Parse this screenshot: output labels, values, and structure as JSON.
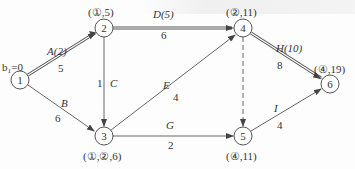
{
  "nodes": [
    {
      "id": "1",
      "x": 20,
      "y": 80,
      "label": "1",
      "annotation": "b₁=0",
      "ann_x": 2,
      "ann_y": 62
    },
    {
      "id": "2",
      "x": 104,
      "y": 28,
      "label": "2",
      "annotation": "(①,5)",
      "ann_x": 88,
      "ann_y": 7
    },
    {
      "id": "3",
      "x": 104,
      "y": 136,
      "label": "3",
      "annotation": "(①,②,6)",
      "ann_x": 83,
      "ann_y": 151
    },
    {
      "id": "4",
      "x": 243,
      "y": 28,
      "label": "4",
      "annotation": "(②,11)",
      "ann_x": 226,
      "ann_y": 7
    },
    {
      "id": "5",
      "x": 243,
      "y": 136,
      "label": "5",
      "annotation": "(④,11)",
      "ann_x": 226,
      "ann_y": 151
    },
    {
      "id": "6",
      "x": 330,
      "y": 84,
      "label": "6",
      "annotation": "(④,19)",
      "ann_x": 314,
      "ann_y": 64
    }
  ],
  "edges": [
    {
      "from": "1",
      "to": "2",
      "name": "A(2)",
      "weight": "5",
      "critical": true,
      "dashed": false
    },
    {
      "from": "1",
      "to": "3",
      "name": "B",
      "weight": "6",
      "critical": false,
      "dashed": false
    },
    {
      "from": "2",
      "to": "3",
      "name": "C",
      "weight": "1",
      "critical": false,
      "dashed": false
    },
    {
      "from": "2",
      "to": "4",
      "name": "D(5)",
      "weight": "6",
      "critical": true,
      "dashed": false
    },
    {
      "from": "3",
      "to": "4",
      "name": "E",
      "weight": "4",
      "critical": false,
      "dashed": false
    },
    {
      "from": "3",
      "to": "5",
      "name": "G",
      "weight": "2",
      "critical": false,
      "dashed": false
    },
    {
      "from": "4",
      "to": "5",
      "name": "",
      "weight": "",
      "critical": false,
      "dashed": true
    },
    {
      "from": "4",
      "to": "6",
      "name": "H(10)",
      "weight": "8",
      "critical": true,
      "dashed": false
    },
    {
      "from": "5",
      "to": "6",
      "name": "I",
      "weight": "4",
      "critical": false,
      "dashed": false
    }
  ],
  "labels": {
    "A": {
      "text": "A(2)",
      "x": 47,
      "y": 46
    },
    "A_w": {
      "text": "5",
      "x": 58,
      "y": 63
    },
    "B": {
      "text": "B",
      "x": 61,
      "y": 98
    },
    "B_w": {
      "text": "6",
      "x": 55,
      "y": 113
    },
    "C": {
      "text": "C",
      "x": 110,
      "y": 78
    },
    "C_w": {
      "text": "1",
      "x": 97,
      "y": 78
    },
    "D": {
      "text": "D(5)",
      "x": 153,
      "y": 8
    },
    "D_w": {
      "text": "6",
      "x": 161,
      "y": 30
    },
    "E": {
      "text": "E",
      "x": 163,
      "y": 80
    },
    "E_w": {
      "text": "4",
      "x": 173,
      "y": 92
    },
    "G": {
      "text": "G",
      "x": 166,
      "y": 120
    },
    "G_w": {
      "text": "2",
      "x": 168,
      "y": 140
    },
    "H": {
      "text": "H(10)",
      "x": 276,
      "y": 43
    },
    "H_w": {
      "text": "8",
      "x": 277,
      "y": 60
    },
    "I": {
      "text": "I",
      "x": 274,
      "y": 103
    },
    "I_w": {
      "text": "4",
      "x": 277,
      "y": 120
    }
  }
}
